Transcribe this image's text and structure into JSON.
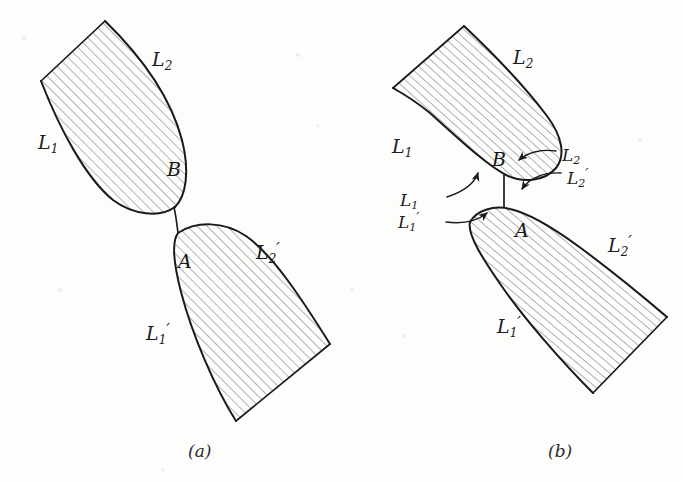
{
  "figure": {
    "background_color": "#fdfdfc",
    "ink_color": "#1a1a1a",
    "hatch_color": "#6f6f6f",
    "panels": [
      {
        "id": "panel-a",
        "caption": "(a)",
        "caption_x": 188,
        "caption_y": 441,
        "description": "Two tapered hatched bodies meeting at a narrow neck between point B above and point A below",
        "point_labels": [
          {
            "name": "point-b",
            "text": "B",
            "x": 167,
            "y": 158
          },
          {
            "name": "point-a",
            "text": "A",
            "x": 178,
            "y": 250
          }
        ],
        "curve_labels": [
          {
            "name": "label-L2-upper",
            "base": "L",
            "sub": "2",
            "prime": "",
            "x": 152,
            "y": 50
          },
          {
            "name": "label-L1-upper",
            "base": "L",
            "sub": "1",
            "prime": "",
            "x": 38,
            "y": 133
          },
          {
            "name": "label-L2-prime-lower",
            "base": "L",
            "sub": "2",
            "prime": "′",
            "x": 256,
            "y": 243
          },
          {
            "name": "label-L1-prime-lower",
            "base": "L",
            "sub": "1",
            "prime": "′",
            "x": 146,
            "y": 324
          }
        ]
      },
      {
        "id": "panel-b",
        "caption": "(b)",
        "caption_x": 548,
        "caption_y": 441,
        "description": "Two rounded-end hatched bars nearly touching, with four curved leader arrows identifying the four boundary curves at the contact neck",
        "point_labels": [
          {
            "name": "point-b",
            "text": "B",
            "x": 492,
            "y": 148
          },
          {
            "name": "point-a",
            "text": "A",
            "x": 515,
            "y": 219
          }
        ],
        "curve_labels": [
          {
            "name": "label-L2-upper",
            "base": "L",
            "sub": "2",
            "prime": "",
            "x": 513,
            "y": 48
          },
          {
            "name": "label-L1-upper",
            "base": "L",
            "sub": "1",
            "prime": "",
            "x": 392,
            "y": 137
          },
          {
            "name": "label-L2-arrow",
            "base": "L",
            "sub": "2",
            "prime": "",
            "x": 562,
            "y": 147
          },
          {
            "name": "label-L2-prime-arrow",
            "base": "L",
            "sub": "2",
            "prime": "′",
            "x": 567,
            "y": 170
          },
          {
            "name": "label-L1-arrow",
            "base": "L",
            "sub": "1",
            "prime": "",
            "x": 426,
            "y": 192
          },
          {
            "name": "label-L1-prime-arrow",
            "base": "L",
            "sub": "1",
            "prime": "′",
            "x": 424,
            "y": 214
          },
          {
            "name": "label-L2-prime-lower",
            "base": "L",
            "sub": "2",
            "prime": "′",
            "x": 608,
            "y": 236
          },
          {
            "name": "label-L1-prime-lower",
            "base": "L",
            "sub": "1",
            "prime": "′",
            "x": 497,
            "y": 317
          }
        ]
      }
    ]
  }
}
